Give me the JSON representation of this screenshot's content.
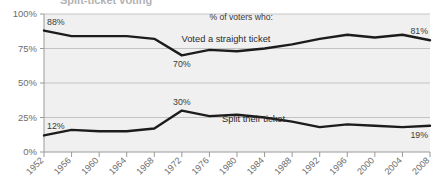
{
  "title_clipped": "Split-ticket voting",
  "chart_data": {
    "type": "line",
    "title": "",
    "xlabel": "",
    "ylabel": "",
    "ylim": [
      0,
      100
    ],
    "grid": true,
    "legend_position": "inline-annotation",
    "header_note": "% of voters who:",
    "categories": [
      "1952",
      "1956",
      "1960",
      "1964",
      "1968",
      "1972",
      "1976",
      "1980",
      "1984",
      "1988",
      "1992",
      "1996",
      "2000",
      "2004",
      "2008"
    ],
    "ytick_labels": [
      "0%",
      "25%",
      "50%",
      "75%",
      "100%"
    ],
    "ytick_values": [
      0,
      25,
      50,
      75,
      100
    ],
    "series": [
      {
        "name": "Voted a straight ticket",
        "color": "#1c1c1c",
        "values": [
          88,
          84,
          84,
          84,
          82,
          70,
          74,
          73,
          75,
          78,
          82,
          85,
          83,
          85,
          81
        ],
        "endpoint_labels": [
          {
            "index": 0,
            "text": "88%",
            "position": "above"
          },
          {
            "index": 5,
            "text": "70%",
            "position": "below"
          },
          {
            "index": 14,
            "text": "81%",
            "position": "above"
          }
        ]
      },
      {
        "name": "Split their ticket",
        "color": "#1c1c1c",
        "values": [
          12,
          16,
          15,
          15,
          17,
          30,
          26,
          27,
          25,
          22,
          18,
          20,
          19,
          18,
          19
        ],
        "endpoint_labels": [
          {
            "index": 0,
            "text": "12%",
            "position": "above"
          },
          {
            "index": 5,
            "text": "30%",
            "position": "above"
          },
          {
            "index": 14,
            "text": "19%",
            "position": "below"
          }
        ]
      }
    ],
    "series_inline_labels": [
      {
        "text": "Voted a straight ticket",
        "x_index": 6.6,
        "y_value": 80
      },
      {
        "text": "Split their ticket",
        "x_index": 7.6,
        "y_value": 22
      }
    ],
    "colors": {
      "plot_background": "#f0f0f0",
      "gridline": "#b8b8b8",
      "axis": "#9a9a9a",
      "line": "#1c1c1c",
      "tick_text": "#6d6d6d"
    }
  }
}
